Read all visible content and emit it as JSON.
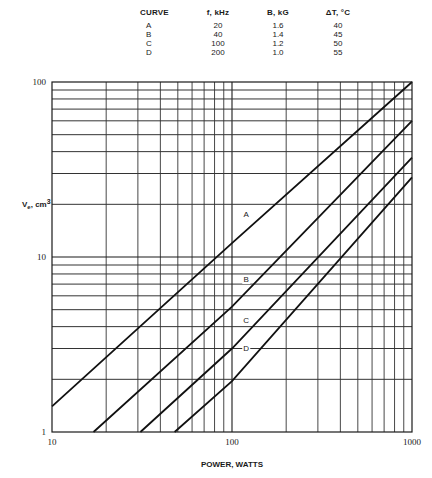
{
  "chart_data": {
    "type": "line",
    "title": "",
    "xlabel": "POWER, WATTS",
    "ylabel": "Ve, cm3",
    "xscale": "log",
    "yscale": "log",
    "xlim": [
      10,
      1000
    ],
    "ylim": [
      1,
      100
    ],
    "grid": true,
    "x_tick_labels": [
      "10",
      "100",
      "1000"
    ],
    "y_tick_labels": [
      "1",
      "10",
      "100"
    ],
    "legend_table": {
      "headers": [
        "CURVE",
        "f, kHz",
        "B, kG",
        "ΔT, °C"
      ],
      "rows": [
        [
          "A",
          "20",
          "1.6",
          "40"
        ],
        [
          "B",
          "40",
          "1.4",
          "45"
        ],
        [
          "C",
          "100",
          "1.2",
          "50"
        ],
        [
          "D",
          "200",
          "1.0",
          "55"
        ]
      ]
    },
    "series": [
      {
        "name": "A",
        "x": [
          10,
          100,
          1000
        ],
        "y": [
          1.4,
          12,
          100
        ],
        "label_at": [
          120,
          17
        ]
      },
      {
        "name": "B",
        "x": [
          17,
          100,
          1000
        ],
        "y": [
          1,
          5.2,
          60
        ],
        "label_at": [
          120,
          7.2
        ]
      },
      {
        "name": "C",
        "x": [
          31,
          100,
          1000
        ],
        "y": [
          1,
          3,
          37
        ],
        "label_at": [
          120,
          4.2
        ]
      },
      {
        "name": "D",
        "x": [
          48,
          100,
          1000
        ],
        "y": [
          1,
          1.95,
          28.5
        ],
        "label_at": [
          120,
          2.9
        ]
      }
    ]
  }
}
